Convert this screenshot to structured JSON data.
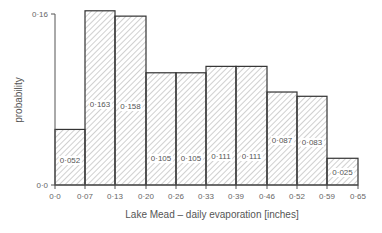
{
  "chart_data": {
    "type": "bar",
    "subtype": "histogram",
    "title": "",
    "xlabel": "Lake Mead – daily evaporation [inches]",
    "ylabel": "probability",
    "x_edges": [
      "0·0",
      "0·07",
      "0·13",
      "0·20",
      "0·26",
      "0·33",
      "0·39",
      "0·46",
      "0·52",
      "0·59",
      "0·65"
    ],
    "categories": [
      "0.0-0.07",
      "0.07-0.13",
      "0.13-0.20",
      "0.20-0.26",
      "0.26-0.33",
      "0.33-0.39",
      "0.39-0.46",
      "0.46-0.52",
      "0.52-0.59",
      "0.59-0.65"
    ],
    "values": [
      0.052,
      0.163,
      0.158,
      0.105,
      0.105,
      0.111,
      0.111,
      0.087,
      0.083,
      0.025
    ],
    "value_labels": [
      "0·052",
      "0·163",
      "0·158",
      "0·105",
      "0·105",
      "0·111",
      "0·111",
      "0·087",
      "0·083",
      "0·025"
    ],
    "y_ticks": [
      "0·0",
      "0·16"
    ],
    "ylim": [
      0,
      0.16
    ],
    "xlim": [
      0,
      0.65
    ],
    "grid": false,
    "legend": null,
    "fill": "diagonal-hatch",
    "colors": {
      "bar_edge": "#333333",
      "hatch": "#888888",
      "axis": "#555555"
    }
  }
}
